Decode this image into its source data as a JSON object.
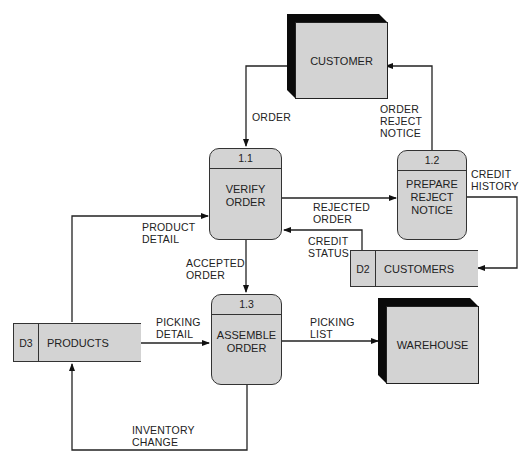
{
  "diagram": {
    "type": "data-flow-diagram",
    "external_entities": [
      {
        "id": "customer",
        "label": "CUSTOMER"
      },
      {
        "id": "warehouse",
        "label": "WAREHOUSE"
      }
    ],
    "processes": [
      {
        "id": "1.1",
        "number": "1.1",
        "label": "VERIFY\nORDER"
      },
      {
        "id": "1.2",
        "number": "1.2",
        "label": "PREPARE\nREJECT\nNOTICE"
      },
      {
        "id": "1.3",
        "number": "1.3",
        "label": "ASSEMBLE\nORDER"
      }
    ],
    "data_stores": [
      {
        "id": "D2",
        "number": "D2",
        "label": "CUSTOMERS"
      },
      {
        "id": "D3",
        "number": "D3",
        "label": "PRODUCTS"
      }
    ],
    "flows": [
      {
        "from": "customer",
        "to": "1.1",
        "label": "ORDER"
      },
      {
        "from": "1.2",
        "to": "customer",
        "label": "ORDER\nREJECT\nNOTICE"
      },
      {
        "from": "1.1",
        "to": "1.2",
        "label": "REJECTED\nORDER"
      },
      {
        "from": "1.2",
        "to": "D2",
        "label": "CREDIT\nHISTORY"
      },
      {
        "from": "D2",
        "to": "1.1",
        "label": "CREDIT\nSTATUS"
      },
      {
        "from": "D3",
        "to": "1.1",
        "label": "PRODUCT\nDETAIL"
      },
      {
        "from": "1.1",
        "to": "1.3",
        "label": "ACCEPTED\nORDER"
      },
      {
        "from": "D3",
        "to": "1.3",
        "label": "PICKING\nDETAIL"
      },
      {
        "from": "1.3",
        "to": "warehouse",
        "label": "PICKING\nLIST"
      },
      {
        "from": "1.3",
        "to": "D3",
        "label": "INVENTORY\nCHANGE"
      }
    ]
  },
  "colors": {
    "fill": "#d3d3d3",
    "stroke": "#222222",
    "shadow": "#0a0a0a",
    "background": "#ffffff"
  }
}
